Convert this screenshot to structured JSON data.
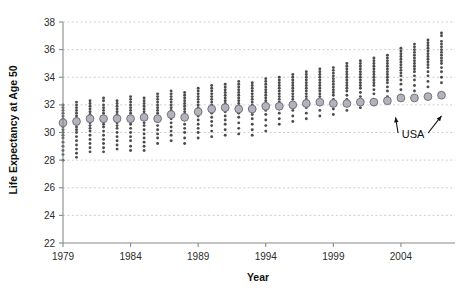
{
  "chart_data": {
    "type": "scatter",
    "title": "",
    "xlabel": "Year",
    "ylabel": "Life Expectancy at Age 50",
    "xlim": [
      1979,
      2008
    ],
    "ylim": [
      22,
      38
    ],
    "xticks": [
      1979,
      1984,
      1989,
      1994,
      1999,
      2004
    ],
    "xtick_labels": [
      "1979",
      "1984",
      "1989",
      "1994",
      "1999",
      "2004"
    ],
    "yticks": [
      22,
      24,
      26,
      28,
      30,
      32,
      34,
      36,
      38
    ],
    "ytick_labels": [
      "22",
      "24",
      "26",
      "28",
      "30",
      "32",
      "34",
      "36",
      "38"
    ],
    "grid": true,
    "legend_position": "none",
    "annotations": [
      {
        "text": "USA",
        "x": 2004.9,
        "y": 29.6,
        "arrows": [
          {
            "to_x": 2003.6,
            "to_y": 31.1
          },
          {
            "to_x": 2007.0,
            "to_y": 31.2
          }
        ]
      }
    ],
    "series": [
      {
        "name": "USA",
        "marker": "large-circle",
        "x": [
          1979,
          1980,
          1981,
          1982,
          1983,
          1984,
          1985,
          1986,
          1987,
          1988,
          1989,
          1990,
          1991,
          1992,
          1993,
          1994,
          1995,
          1996,
          1997,
          1998,
          1999,
          2000,
          2001,
          2002,
          2003,
          2004,
          2005,
          2006,
          2007
        ],
        "values": [
          30.7,
          30.8,
          31.0,
          31.0,
          31.0,
          31.0,
          31.1,
          31.0,
          31.3,
          31.1,
          31.5,
          31.7,
          31.8,
          31.7,
          31.7,
          31.9,
          31.9,
          32.0,
          32.1,
          32.2,
          32.1,
          32.1,
          32.2,
          32.2,
          32.3,
          32.5,
          32.5,
          32.6,
          32.7
        ]
      },
      {
        "name": "Countries",
        "marker": "small-dot",
        "note": "Per-year distribution of individual country values, plotted as vertical strips of small dots.",
        "columns": [
          {
            "x": 1979,
            "values": [
              32.0,
              31.8,
              31.6,
              31.4,
              31.2,
              31.0,
              30.8,
              30.6,
              30.4,
              30.2,
              30.0,
              29.8,
              29.6,
              29.3,
              29.0,
              28.7,
              28.4,
              28.0
            ]
          },
          {
            "x": 1980,
            "values": [
              32.2,
              32.0,
              31.8,
              31.6,
              31.4,
              31.2,
              31.0,
              30.8,
              30.6,
              30.4,
              30.2,
              30.0,
              29.7,
              29.4,
              29.1,
              28.8,
              28.5,
              28.2
            ]
          },
          {
            "x": 1981,
            "values": [
              32.3,
              32.1,
              31.9,
              31.7,
              31.5,
              31.3,
              31.1,
              30.9,
              30.7,
              30.5,
              30.3,
              30.1,
              29.8,
              29.5,
              29.2,
              28.9,
              28.6
            ]
          },
          {
            "x": 1982,
            "values": [
              32.5,
              32.3,
              32.0,
              31.8,
              31.6,
              31.4,
              31.2,
              31.0,
              30.8,
              30.6,
              30.4,
              30.1,
              29.8,
              29.5,
              29.2,
              28.9,
              28.6
            ]
          },
          {
            "x": 1983,
            "values": [
              32.3,
              32.1,
              31.9,
              31.7,
              31.5,
              31.3,
              31.1,
              30.9,
              30.7,
              30.5,
              30.3,
              30.0,
              29.7,
              29.4,
              29.1,
              28.8
            ]
          },
          {
            "x": 1984,
            "values": [
              32.6,
              32.4,
              32.2,
              32.0,
              31.8,
              31.6,
              31.4,
              31.2,
              31.0,
              30.8,
              30.6,
              30.3,
              30.0,
              29.7,
              29.4,
              29.0,
              28.7
            ]
          },
          {
            "x": 1985,
            "values": [
              32.5,
              32.3,
              32.1,
              31.9,
              31.7,
              31.5,
              31.3,
              31.1,
              30.9,
              30.7,
              30.5,
              30.2,
              29.9,
              29.6,
              29.3,
              29.0,
              28.7
            ]
          },
          {
            "x": 1986,
            "values": [
              32.8,
              32.6,
              32.4,
              32.2,
              32.0,
              31.8,
              31.6,
              31.4,
              31.2,
              31.0,
              30.8,
              30.5,
              30.2,
              29.9,
              29.6,
              29.2
            ]
          },
          {
            "x": 1987,
            "values": [
              33.0,
              32.8,
              32.6,
              32.4,
              32.2,
              32.0,
              31.8,
              31.6,
              31.4,
              31.2,
              31.0,
              30.7,
              30.4,
              30.1,
              29.8,
              29.4
            ]
          },
          {
            "x": 1988,
            "values": [
              32.9,
              32.7,
              32.5,
              32.3,
              32.1,
              31.9,
              31.7,
              31.5,
              31.3,
              31.1,
              30.9,
              30.6,
              30.3,
              30.0,
              29.6,
              29.2
            ]
          },
          {
            "x": 1989,
            "values": [
              33.2,
              33.0,
              32.8,
              32.6,
              32.4,
              32.2,
              32.0,
              31.8,
              31.6,
              31.4,
              31.2,
              30.9,
              30.6,
              30.3,
              30.0,
              29.6
            ]
          },
          {
            "x": 1990,
            "values": [
              33.4,
              33.2,
              33.0,
              32.8,
              32.6,
              32.4,
              32.2,
              32.0,
              31.8,
              31.6,
              31.4,
              31.1,
              30.8,
              30.5,
              30.1,
              29.7
            ]
          },
          {
            "x": 1991,
            "values": [
              33.5,
              33.3,
              33.1,
              32.9,
              32.7,
              32.5,
              32.3,
              32.1,
              31.9,
              31.7,
              31.5,
              31.2,
              30.9,
              30.6,
              30.2,
              29.8
            ]
          },
          {
            "x": 1992,
            "values": [
              33.7,
              33.5,
              33.3,
              33.1,
              32.9,
              32.7,
              32.5,
              32.3,
              32.1,
              31.9,
              31.7,
              31.4,
              31.1,
              30.7,
              30.3,
              29.9
            ]
          },
          {
            "x": 1993,
            "values": [
              33.6,
              33.4,
              33.2,
              33.0,
              32.8,
              32.6,
              32.4,
              32.2,
              32.0,
              31.8,
              31.6,
              31.3,
              31.0,
              30.6,
              30.2,
              29.8
            ]
          },
          {
            "x": 1994,
            "values": [
              33.9,
              33.7,
              33.5,
              33.3,
              33.1,
              32.9,
              32.7,
              32.5,
              32.3,
              32.1,
              31.9,
              31.6,
              31.3,
              30.9,
              30.5,
              30.1
            ]
          },
          {
            "x": 1995,
            "values": [
              34.0,
              33.8,
              33.6,
              33.4,
              33.2,
              33.0,
              32.8,
              32.6,
              32.4,
              32.2,
              32.0,
              31.7,
              31.4,
              31.0,
              30.6
            ]
          },
          {
            "x": 1996,
            "values": [
              34.2,
              34.0,
              33.8,
              33.6,
              33.4,
              33.2,
              33.0,
              32.8,
              32.6,
              32.4,
              32.2,
              31.9,
              31.6,
              31.2,
              30.8
            ]
          },
          {
            "x": 1997,
            "values": [
              34.4,
              34.2,
              34.0,
              33.8,
              33.6,
              33.4,
              33.2,
              33.0,
              32.8,
              32.6,
              32.4,
              32.1,
              31.8,
              31.4,
              31.0
            ]
          },
          {
            "x": 1998,
            "values": [
              34.6,
              34.4,
              34.2,
              34.0,
              33.8,
              33.6,
              33.4,
              33.2,
              33.0,
              32.8,
              32.6,
              32.3,
              32.0,
              31.6,
              31.2
            ]
          },
          {
            "x": 1999,
            "values": [
              34.7,
              34.5,
              34.3,
              34.1,
              33.9,
              33.7,
              33.5,
              33.3,
              33.1,
              32.9,
              32.7,
              32.4,
              32.1,
              31.7,
              31.3
            ]
          },
          {
            "x": 2000,
            "values": [
              35.0,
              34.8,
              34.6,
              34.4,
              34.2,
              34.0,
              33.8,
              33.6,
              33.4,
              33.2,
              33.0,
              32.7,
              32.4,
              32.0,
              31.6
            ]
          },
          {
            "x": 2001,
            "values": [
              35.2,
              35.0,
              34.8,
              34.6,
              34.4,
              34.2,
              34.0,
              33.8,
              33.6,
              33.4,
              33.2,
              32.9,
              32.6,
              32.2,
              31.8
            ]
          },
          {
            "x": 2002,
            "values": [
              35.4,
              35.2,
              35.0,
              34.8,
              34.6,
              34.4,
              34.2,
              34.0,
              33.8,
              33.6,
              33.4,
              33.1,
              32.8,
              32.4,
              32.0
            ]
          },
          {
            "x": 2003,
            "values": [
              35.6,
              35.4,
              35.2,
              35.0,
              34.8,
              34.6,
              34.4,
              34.2,
              34.0,
              33.8,
              33.6,
              33.3,
              33.0,
              32.6,
              32.2
            ]
          },
          {
            "x": 2004,
            "values": [
              36.1,
              35.9,
              35.7,
              35.5,
              35.3,
              35.1,
              34.9,
              34.7,
              34.5,
              34.3,
              34.1,
              33.8,
              33.5,
              33.1,
              32.7
            ]
          },
          {
            "x": 2005,
            "values": [
              36.4,
              36.2,
              36.0,
              35.8,
              35.6,
              35.4,
              35.2,
              35.0,
              34.8,
              34.6,
              34.4,
              34.1,
              33.8,
              33.4,
              33.0
            ]
          },
          {
            "x": 2006,
            "values": [
              36.7,
              36.5,
              36.3,
              36.1,
              35.9,
              35.7,
              35.5,
              35.3,
              35.1,
              34.9,
              34.7,
              34.4,
              34.1,
              33.7,
              33.3
            ]
          },
          {
            "x": 2007,
            "values": [
              37.2,
              37.0,
              36.6,
              36.4,
              36.2,
              36.0,
              35.8,
              35.6,
              35.4,
              35.2,
              35.0,
              34.7,
              34.4,
              34.0,
              33.6
            ]
          }
        ]
      }
    ]
  }
}
